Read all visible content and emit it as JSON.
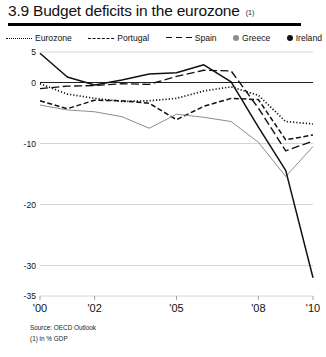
{
  "header": {
    "title": "3.9 Budget deficits in the eurozone",
    "title_note": "(1)"
  },
  "legend": {
    "items": [
      {
        "label": "Eurozone",
        "marker": "dotted-line-icon",
        "color": "#111111"
      },
      {
        "label": "Portugal",
        "marker": "dashed-line-icon",
        "color": "#111111"
      },
      {
        "label": "Spain",
        "marker": "long-dash-line-icon",
        "color": "#111111"
      },
      {
        "label": "Greece",
        "marker": "grey-dot-icon",
        "color": "#8d8d8d"
      },
      {
        "label": "Ireland",
        "marker": "black-dot-icon",
        "color": "#111111"
      }
    ]
  },
  "footnotes": {
    "source": "Source: OECD Outlook",
    "note": "(1) in % GDP"
  },
  "chart_data": {
    "type": "line",
    "title": "3.9 Budget deficits in the eurozone",
    "xlabel": "",
    "ylabel": "",
    "unit": "% GDP",
    "grid": true,
    "legend_position": "top",
    "xlim": [
      2000,
      2010
    ],
    "ylim": [
      -35,
      5
    ],
    "ytick_labels": [
      "5",
      "0",
      "-10",
      "-20",
      "-30",
      "-35"
    ],
    "ytick_values": [
      5,
      0,
      -10,
      -20,
      -30,
      -35
    ],
    "xtick_labels": [
      "'00",
      "'02",
      "'05",
      "'08",
      "'10"
    ],
    "xtick_values": [
      2000,
      2002,
      2005,
      2008,
      2010
    ],
    "x": [
      2000,
      2001,
      2002,
      2003,
      2004,
      2005,
      2006,
      2007,
      2008,
      2009,
      2010
    ],
    "series": [
      {
        "name": "Eurozone",
        "style": "dotted",
        "color": "#111111",
        "values": [
          -0.2,
          -1.9,
          -2.6,
          -3.1,
          -3.0,
          -2.6,
          -1.4,
          -0.7,
          -2.1,
          -6.4,
          -6.8
        ]
      },
      {
        "name": "Portugal",
        "style": "dashed",
        "color": "#111111",
        "values": [
          -3.0,
          -4.3,
          -2.9,
          -3.0,
          -3.4,
          -6.1,
          -3.9,
          -2.6,
          -2.8,
          -9.4,
          -8.6
        ]
      },
      {
        "name": "Spain",
        "style": "long-dash",
        "color": "#111111",
        "values": [
          -1.0,
          -0.6,
          -0.5,
          -0.2,
          -0.3,
          1.0,
          2.0,
          1.9,
          -4.2,
          -11.2,
          -9.6
        ]
      },
      {
        "name": "Greece",
        "style": "solid-grey",
        "color": "#8d8d8d",
        "values": [
          -3.7,
          -4.5,
          -4.8,
          -5.6,
          -7.5,
          -5.2,
          -5.7,
          -6.4,
          -9.8,
          -15.4,
          -10.5
        ]
      },
      {
        "name": "Ireland",
        "style": "solid-black",
        "color": "#111111",
        "values": [
          4.8,
          0.9,
          -0.4,
          0.4,
          1.4,
          1.6,
          2.9,
          0.1,
          -7.3,
          -14.4,
          -32.0
        ]
      }
    ]
  }
}
